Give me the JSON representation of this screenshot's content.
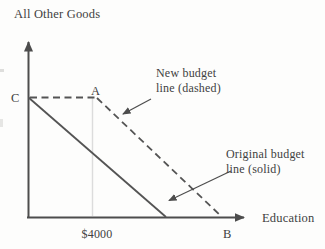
{
  "figure": {
    "y_axis_label": "All Other Goods",
    "x_axis_label": "Education",
    "x_tick_label": "$4000",
    "point_labels": {
      "c": "C",
      "a": "A",
      "b": "B"
    },
    "annotations": {
      "new_budget_line1": "New budget",
      "new_budget_line2": "line (dashed)",
      "original_budget_line1": "Original budget",
      "original_budget_line2": "line (solid)"
    },
    "colors": {
      "axis": "#4d4d4d",
      "budget_line": "#545454",
      "guide_line": "#dcdcdc",
      "text": "#414141",
      "background": "#fdfdfc"
    }
  }
}
